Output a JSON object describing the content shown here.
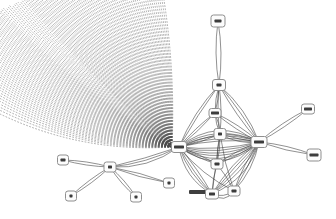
{
  "canvas": {
    "width": 336,
    "height": 219,
    "background": "#ffffff"
  },
  "graph": {
    "description": "network-graph-with-dotted-edge-bundle-fan",
    "colors": {
      "edge": "#3d3d3d",
      "node_border": "#8f8f8f",
      "node_fill": "#fcfcfc",
      "label_blob": "#3c3c3c",
      "fan": "#4a4a4a"
    },
    "nodes": [
      {
        "id": "t1",
        "x": 218,
        "y": 21,
        "w": 14,
        "h": 12,
        "blob": 7
      },
      {
        "id": "t2",
        "x": 219,
        "y": 85,
        "w": 13,
        "h": 11,
        "blob": 5
      },
      {
        "id": "x",
        "x": 215,
        "y": 113,
        "w": 12,
        "h": 9,
        "blob": 8
      },
      {
        "id": "b",
        "x": 220,
        "y": 134,
        "w": 12,
        "h": 11,
        "blob": 4
      },
      {
        "id": "a",
        "x": 179,
        "y": 147,
        "w": 15,
        "h": 11,
        "blob": 10
      },
      {
        "id": "c",
        "x": 259,
        "y": 142,
        "w": 16,
        "h": 11,
        "blob": 10
      },
      {
        "id": "d",
        "x": 217,
        "y": 164,
        "w": 12,
        "h": 10,
        "blob": 5
      },
      {
        "id": "e",
        "x": 212,
        "y": 194,
        "w": 13,
        "h": 10,
        "blob": 6
      },
      {
        "id": "f",
        "x": 234,
        "y": 191,
        "w": 12,
        "h": 10,
        "blob": 5
      },
      {
        "id": "r1",
        "x": 308,
        "y": 109,
        "w": 13,
        "h": 10,
        "blob": 8
      },
      {
        "id": "r2",
        "x": 314,
        "y": 155,
        "w": 14,
        "h": 12,
        "blob": 9
      },
      {
        "id": "s",
        "x": 110,
        "y": 167,
        "w": 12,
        "h": 10,
        "blob": 4
      },
      {
        "id": "s1",
        "x": 63,
        "y": 160,
        "w": 11,
        "h": 10,
        "blob": 5
      },
      {
        "id": "s2",
        "x": 71,
        "y": 196,
        "w": 11,
        "h": 10,
        "blob": 3
      },
      {
        "id": "s3",
        "x": 136,
        "y": 197,
        "w": 11,
        "h": 10,
        "blob": 3
      },
      {
        "id": "s4",
        "x": 169,
        "y": 183,
        "w": 11,
        "h": 10,
        "blob": 3
      }
    ],
    "edges": [
      {
        "from": "t1",
        "to": "t2",
        "offsets": [
          -5,
          5
        ]
      },
      {
        "from": "t2",
        "to": "a",
        "offsets": [
          2,
          7
        ]
      },
      {
        "from": "t2",
        "to": "b",
        "offsets": [
          -3,
          3
        ]
      },
      {
        "from": "t2",
        "to": "x",
        "offsets": [
          -2,
          2
        ]
      },
      {
        "from": "t2",
        "to": "c",
        "offsets": [
          -9,
          -3,
          4
        ]
      },
      {
        "from": "x",
        "to": "a",
        "offsets": [
          -2,
          3
        ]
      },
      {
        "from": "x",
        "to": "b",
        "offsets": [
          -2,
          2
        ]
      },
      {
        "from": "x",
        "to": "c",
        "offsets": [
          -4,
          3
        ]
      },
      {
        "from": "b",
        "to": "a",
        "offsets": [
          -3,
          2
        ]
      },
      {
        "from": "b",
        "to": "c",
        "offsets": [
          -4,
          2,
          7
        ]
      },
      {
        "from": "b",
        "to": "d",
        "offsets": [
          -2,
          2
        ]
      },
      {
        "from": "b",
        "to": "e",
        "offsets": [
          0
        ]
      },
      {
        "from": "b",
        "to": "f",
        "offsets": [
          3
        ]
      },
      {
        "from": "a",
        "to": "c",
        "offsets": [
          -28,
          -22,
          -17,
          -12,
          -7,
          7,
          12,
          17,
          22,
          28,
          33
        ]
      },
      {
        "from": "a",
        "to": "d",
        "offsets": [
          -2,
          3
        ]
      },
      {
        "from": "d",
        "to": "c",
        "offsets": [
          -3,
          3
        ]
      },
      {
        "from": "d",
        "to": "e",
        "offsets": [
          2
        ]
      },
      {
        "from": "d",
        "to": "f",
        "offsets": [
          -2
        ]
      },
      {
        "from": "a",
        "to": "e",
        "offsets": [
          -3,
          3,
          8,
          14
        ]
      },
      {
        "from": "e",
        "to": "c",
        "offsets": [
          -7,
          -2,
          4,
          10,
          17
        ]
      },
      {
        "from": "e",
        "to": "f",
        "offsets": [
          6,
          12
        ]
      },
      {
        "from": "f",
        "to": "c",
        "offsets": [
          -4,
          2,
          8
        ]
      },
      {
        "from": "a",
        "to": "f",
        "offsets": [
          8
        ]
      },
      {
        "from": "c",
        "to": "r1",
        "offsets": [
          -4,
          3
        ]
      },
      {
        "from": "c",
        "to": "r2",
        "offsets": [
          -4,
          3
        ]
      },
      {
        "from": "s",
        "to": "a",
        "offsets": [
          2,
          7,
          13
        ]
      },
      {
        "from": "s",
        "to": "s1",
        "offsets": [
          -3,
          3
        ]
      },
      {
        "from": "s",
        "to": "s2",
        "offsets": [
          -3,
          3
        ]
      },
      {
        "from": "s",
        "to": "s3",
        "offsets": [
          -3,
          3
        ]
      },
      {
        "from": "s",
        "to": "s4",
        "offsets": [
          -3,
          3
        ]
      }
    ],
    "fan": {
      "apex": [
        172,
        147
      ],
      "count": 120,
      "envelope": [
        [
          0,
          114
        ],
        [
          0,
          10
        ],
        [
          24,
          0
        ],
        [
          164,
          0
        ]
      ],
      "density_exponent": 0.9,
      "k_start": 0.13,
      "k_end": -0.05,
      "color": "#4a4a4a",
      "dash": "1 2.2",
      "width": 0.55,
      "opacity": 0.8
    },
    "label_smudge": {
      "x": 189,
      "y": 190,
      "w": 19,
      "h": 4,
      "color": "#2e2e2e"
    }
  }
}
